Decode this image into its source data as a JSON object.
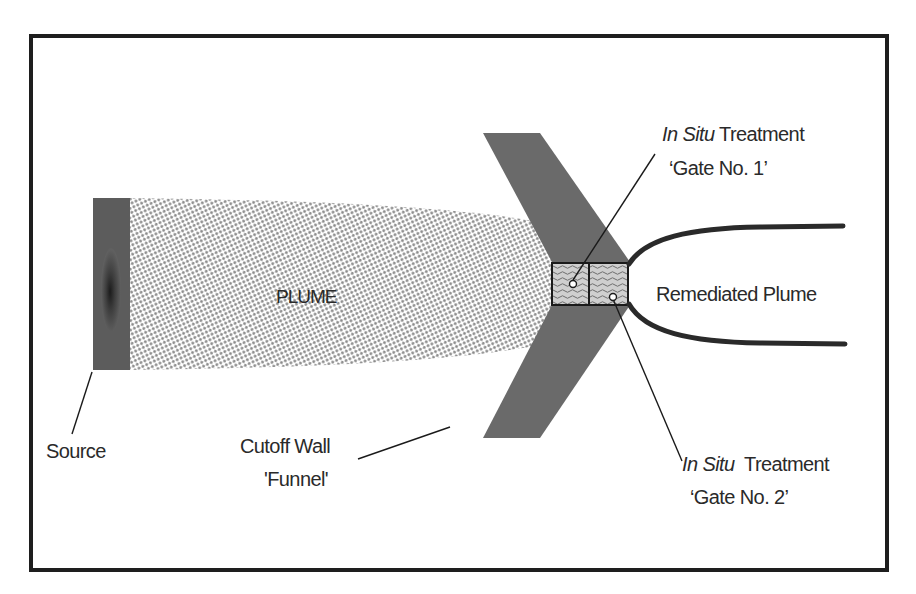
{
  "diagram": {
    "labels": {
      "plume": "PLUME",
      "source": "Source",
      "cutoff_wall_line1": "Cutoff Wall",
      "cutoff_wall_line2": "'Funnel'",
      "remediated_plume": "Remediated Plume",
      "gate1_italic": "In Situ",
      "gate1_rest": " Treatment",
      "gate1_line2": "‘Gate No. 1’",
      "gate2_italic": "In Situ",
      "gate2_rest": "  Treatment",
      "gate2_line2": "‘Gate No. 2’"
    },
    "colors": {
      "frame": "#1e1e1e",
      "source_bar": "#5c5c5c",
      "source_core": "#151515",
      "plume_dots": "#8a8a8a",
      "funnel": "#6a6a6a",
      "gate_fill": "#c8c8c8",
      "gate_wave": "#6e6e6e",
      "outline": "#1a1a1a",
      "text": "#2a2a2a"
    }
  }
}
